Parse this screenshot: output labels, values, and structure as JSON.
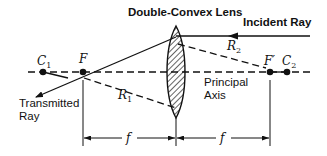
{
  "diagram": {
    "title": "Double-Convex Lens",
    "labels": {
      "incident_ray": "Incident Ray",
      "transmitted_ray_line1": "Transmitted",
      "transmitted_ray_line2": "Ray",
      "principal_axis_line1": "Principal",
      "principal_axis_line2": "Axis",
      "r1": "R",
      "r1_sub": "1",
      "r2": "R",
      "r2_sub": "2",
      "c1": "C",
      "c1_sub": "1",
      "c2": "C",
      "c2_sub": "2",
      "f_point": "F",
      "f_prime_point": "F′",
      "focal_length_left": "f",
      "focal_length_right": "f"
    },
    "colors": {
      "ink": "#111111",
      "background": "#ffffff"
    }
  }
}
